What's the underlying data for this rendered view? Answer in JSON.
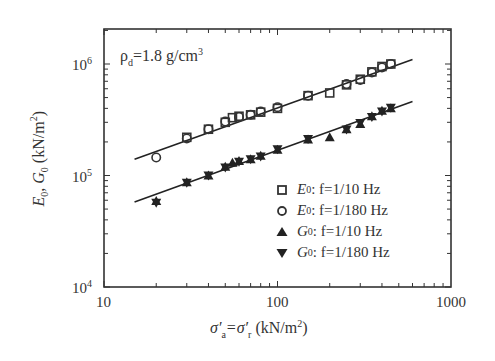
{
  "chart_data": {
    "type": "scatter",
    "title": "",
    "annotation": "ρd = 1.8 g/cm³",
    "xlabel": "σ'a = σ'r (kN/m²)",
    "ylabel": "E0, G0 (kN/m²)",
    "xscale": "log",
    "yscale": "log",
    "xlim": [
      10,
      1000
    ],
    "ylim": [
      10000,
      2000000
    ],
    "x_ticks": [
      "10",
      "100",
      "1000"
    ],
    "y_ticks": [
      "10^4",
      "10^5",
      "10^6"
    ],
    "grid": false,
    "legend_position": "lower right inside",
    "series": [
      {
        "name": "E0 : f=1/10 Hz",
        "marker": "square-open",
        "x": [
          30,
          40,
          50,
          55,
          60,
          70,
          80,
          100,
          150,
          200,
          250,
          300,
          350,
          400,
          450
        ],
        "y": [
          220000,
          260000,
          300000,
          330000,
          340000,
          350000,
          370000,
          400000,
          520000,
          550000,
          650000,
          730000,
          850000,
          950000,
          1000000
        ]
      },
      {
        "name": "E0 : f=1/180 Hz",
        "marker": "circle-open",
        "x": [
          20,
          30,
          40,
          50,
          60,
          70,
          80,
          100,
          150,
          250,
          300,
          350,
          400,
          450
        ],
        "y": [
          145000,
          215000,
          260000,
          305000,
          335000,
          350000,
          375000,
          410000,
          520000,
          660000,
          720000,
          840000,
          930000,
          1000000
        ]
      },
      {
        "name": "G0 : f=1/10 Hz",
        "marker": "triangle-up-filled",
        "x": [
          20,
          30,
          40,
          50,
          55,
          60,
          70,
          80,
          100,
          150,
          200,
          250,
          300,
          350,
          400,
          450
        ],
        "y": [
          59000,
          87000,
          100000,
          120000,
          130000,
          135000,
          140000,
          150000,
          170000,
          210000,
          220000,
          260000,
          290000,
          340000,
          380000,
          400000
        ]
      },
      {
        "name": "G0 : f=1/180 Hz",
        "marker": "triangle-down-filled",
        "x": [
          20,
          30,
          40,
          50,
          60,
          70,
          80,
          100,
          150,
          250,
          300,
          350,
          400,
          450
        ],
        "y": [
          57000,
          86000,
          100000,
          118000,
          133000,
          140000,
          148000,
          172000,
          212000,
          258000,
          295000,
          335000,
          375000,
          405000
        ]
      }
    ],
    "fit_lines": [
      {
        "name": "E0 fit",
        "x": [
          15,
          600
        ],
        "y": [
          140000,
          1100000
        ]
      },
      {
        "name": "G0 fit",
        "x": [
          15,
          600
        ],
        "y": [
          58000,
          460000
        ]
      }
    ]
  },
  "labels": {
    "annotation_rho": "ρ",
    "annotation_sub": "d",
    "annotation_rest": "=1.8 g/cm",
    "annotation_sup": "3",
    "x_tick_10": "10",
    "x_tick_100": "100",
    "x_tick_1000": "1000",
    "y_tick_base": "10",
    "y_exp_4": "4",
    "y_exp_5": "5",
    "y_exp_6": "6",
    "xlabel_sigma_a": "σ′",
    "xlabel_a": "a",
    "xlabel_eq": "=σ′",
    "xlabel_r": "r",
    "xlabel_unit": "(kN/m",
    "xlabel_unit_sup": "2",
    "xlabel_unit_close": ")",
    "ylabel_text": "E0, G0 (kN/m²)"
  },
  "legend": [
    {
      "symbol": "E",
      "sub": "0",
      "text": " : f=1/10 Hz"
    },
    {
      "symbol": "E",
      "sub": "0",
      "text": " : f=1/180 Hz"
    },
    {
      "symbol": "G",
      "sub": "0",
      "text": " : f=1/10 Hz"
    },
    {
      "symbol": "G",
      "sub": "0",
      "text": " : f=1/180 Hz"
    }
  ]
}
